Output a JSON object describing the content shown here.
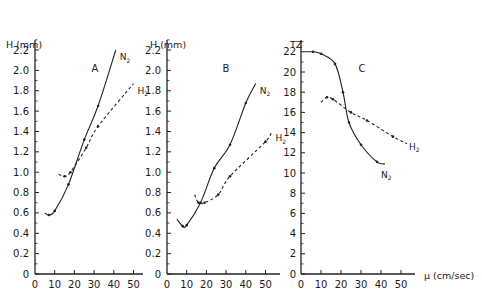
{
  "figure": {
    "x_axis_label": "μ (cm/sec)",
    "x_ticks": [
      "0",
      "10",
      "20",
      "30",
      "40",
      "50"
    ]
  },
  "panels": [
    {
      "letter": "A",
      "ylabel": "H (mm)",
      "y_ticks": [
        "0",
        "0.2",
        "0.4",
        "0.6",
        "0.8",
        "1.0",
        "1.2",
        "1.4",
        "1.6",
        "1.8",
        "2.0",
        "2.2"
      ]
    },
    {
      "letter": "B",
      "ylabel": "H (mm)",
      "y_ticks": [
        "0",
        "0.2",
        "0.4",
        "0.6",
        "0.8",
        "1.0",
        "1.2",
        "1.4",
        "1.6",
        "1.8",
        "2.0",
        "2.2"
      ]
    },
    {
      "letter": "C",
      "ylabel": "TZ",
      "y_ticks": [
        "0",
        "2",
        "4",
        "6",
        "8",
        "10",
        "12",
        "14",
        "16",
        "18",
        "20",
        "22"
      ]
    }
  ],
  "series_labels": {
    "n2": "N",
    "h2": "H",
    "sub": "2"
  },
  "chart_data": [
    {
      "type": "line",
      "title": "A",
      "xlabel": "μ (cm/sec)",
      "ylabel": "H (mm)",
      "xlim": [
        0,
        55
      ],
      "ylim": [
        0,
        2.3
      ],
      "x_ticks": [
        0,
        10,
        20,
        30,
        40,
        50
      ],
      "y_ticks": [
        0,
        0.2,
        0.4,
        0.6,
        0.8,
        1.0,
        1.2,
        1.4,
        1.6,
        1.8,
        2.0,
        2.2
      ],
      "grid": false,
      "series": [
        {
          "name": "N2",
          "style": "solid",
          "x": [
            5,
            7,
            10,
            17,
            25,
            32,
            41
          ],
          "y": [
            0.6,
            0.58,
            0.62,
            0.88,
            1.32,
            1.65,
            2.2
          ]
        },
        {
          "name": "H2",
          "style": "dashed",
          "x": [
            12,
            15,
            18,
            26,
            32,
            50
          ],
          "y": [
            0.98,
            0.96,
            1.0,
            1.24,
            1.45,
            1.87
          ]
        }
      ]
    },
    {
      "type": "line",
      "title": "B",
      "xlabel": "μ (cm/sec)",
      "ylabel": "H (mm)",
      "xlim": [
        0,
        55
      ],
      "ylim": [
        0,
        2.3
      ],
      "x_ticks": [
        0,
        10,
        20,
        30,
        40,
        50
      ],
      "y_ticks": [
        0,
        0.2,
        0.4,
        0.6,
        0.8,
        1.0,
        1.2,
        1.4,
        1.6,
        1.8,
        2.0,
        2.2
      ],
      "grid": false,
      "series": [
        {
          "name": "N2",
          "style": "solid",
          "x": [
            5,
            8,
            10,
            17,
            24,
            32,
            40,
            45
          ],
          "y": [
            0.54,
            0.47,
            0.48,
            0.7,
            1.04,
            1.27,
            1.68,
            1.87
          ]
        },
        {
          "name": "H2",
          "style": "dashed",
          "x": [
            14,
            16,
            19,
            26,
            32,
            50,
            53
          ],
          "y": [
            0.78,
            0.7,
            0.7,
            0.78,
            0.96,
            1.3,
            1.4
          ]
        }
      ]
    },
    {
      "type": "line",
      "title": "C",
      "xlabel": "μ (cm/sec)",
      "ylabel": "TZ",
      "xlim": [
        0,
        57
      ],
      "ylim": [
        0,
        23
      ],
      "x_ticks": [
        0,
        10,
        20,
        30,
        40,
        50
      ],
      "y_ticks": [
        0,
        2,
        4,
        6,
        8,
        10,
        12,
        14,
        16,
        18,
        20,
        22
      ],
      "grid": false,
      "series": [
        {
          "name": "N2",
          "style": "solid",
          "x": [
            2,
            6,
            10,
            17,
            21,
            24,
            30,
            38,
            42
          ],
          "y": [
            22.0,
            22.0,
            21.8,
            20.8,
            18.0,
            15.0,
            12.8,
            11.1,
            10.9
          ]
        },
        {
          "name": "H2",
          "style": "dashed",
          "x": [
            10,
            13,
            16,
            25,
            33,
            46,
            53
          ],
          "y": [
            17.0,
            17.5,
            17.3,
            16.0,
            15.2,
            13.6,
            12.9
          ]
        }
      ]
    }
  ]
}
